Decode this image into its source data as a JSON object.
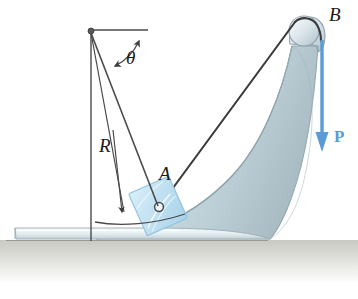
{
  "figure": {
    "kind": "engineering-mechanics-diagram",
    "background_color": "#ffffff"
  },
  "labels": {
    "theta": "θ",
    "radius": "R",
    "point_a": "A",
    "point_b": "B",
    "force": "P"
  },
  "colors": {
    "body_fill_light": "#e8f1f4",
    "body_fill_mid": "#c4d7dd",
    "body_fill_dark": "#aebfc6",
    "body_outline": "#8fa4ac",
    "base_fill_light": "#eef5f7",
    "base_fill_mid": "#cfdde2",
    "ground_shadow": "#cfcfc9",
    "block_fill": "#c3e2f2",
    "block_outline": "#8fc3de",
    "cable": "#3a3a3a",
    "construction_line": "#4a4a4a",
    "force_arrow": "#5b9bd5",
    "label_text": "#1a1a1a"
  },
  "geometry": {
    "pivot": {
      "x": 91,
      "y": 31
    },
    "horizontal_reference_end": {
      "x": 146,
      "y": 30
    },
    "vertical_line_end": {
      "x": 91,
      "y": 241
    },
    "radius_line_end": {
      "x": 157,
      "y": 208
    },
    "pin_at_a": {
      "x": 159,
      "y": 207
    },
    "pulley_center": {
      "x": 304,
      "y": 29
    },
    "pulley_radius": 17,
    "force_arrow": {
      "x": 322,
      "y": 40,
      "tip_y": 150
    },
    "angle_arc": {
      "from_deg": -12,
      "to_deg": 50
    },
    "radius_dim_arrow": {
      "from": {
        "x": 113,
        "y": 130
      },
      "to": {
        "x": 124,
        "y": 218
      }
    },
    "swing_arc": {
      "start": {
        "x": 96,
        "y": 222
      },
      "end": {
        "x": 184,
        "y": 214
      }
    }
  }
}
